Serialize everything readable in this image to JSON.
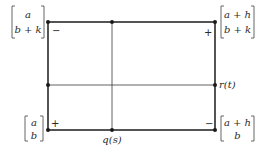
{
  "corners": {
    "top_left": {
      "row1": "a",
      "row2": "b + k",
      "sign": "−"
    },
    "top_right": {
      "row1": "a + h",
      "row2": "b + k",
      "sign": "+"
    },
    "bottom_left": {
      "row1": "a",
      "row2": "b",
      "sign": "+"
    },
    "bottom_right": {
      "row1": "a + h",
      "row2": "b",
      "sign": "−"
    }
  },
  "labels": {
    "bottom_mid": "q(s)",
    "right_mid": "r(t)"
  }
}
